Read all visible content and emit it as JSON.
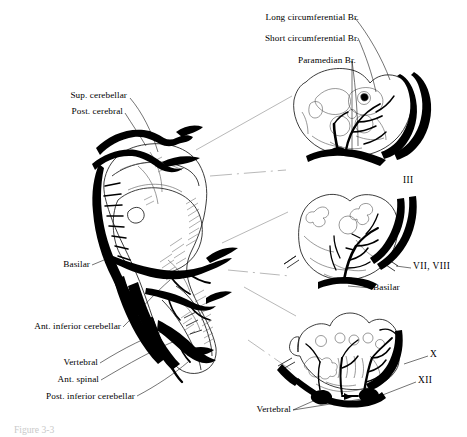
{
  "figure": {
    "title_caption": "Figure 3-3",
    "caption_visible": true
  },
  "labels": {
    "long_circumferential": "Long circumferential Br.",
    "short_circumferential": "Short circumferential Br.",
    "paramedian": "Paramedian Br.",
    "sup_cerebellar": "Sup. cerebellar",
    "post_cerebral": "Post. cerebral",
    "basilar_main": "Basilar",
    "ant_inferior_cerebellar": "Ant. inferior cerebellar",
    "vertebral_left": "Vertebral",
    "ant_spinal": "Ant. spinal",
    "post_inferior_cerebellar": "Post. inferior cerebellar",
    "basilar_section": "Basilar",
    "vertebral_bottom": "Vertebral"
  },
  "cranial_nerves": {
    "midbrain": "III",
    "pons": "VII, VIII",
    "medulla_vagus": "X",
    "medulla_hypoglossal": "XII"
  },
  "sections": [
    {
      "name": "midbrain-section",
      "nerve_label": "III",
      "branch_labels": [
        "Long circumferential Br.",
        "Short circumferential Br.",
        "Paramedian Br."
      ]
    },
    {
      "name": "pons-section",
      "nerve_label": "VII, VIII",
      "artery_labels": [
        "Basilar"
      ]
    },
    {
      "name": "medulla-section",
      "nerve_labels": [
        "X",
        "XII"
      ],
      "artery_labels": [
        "Vertebral"
      ]
    }
  ],
  "colors": {
    "ink": "#000000",
    "outline": "#1a1a1a",
    "hatch": "#4a4a4a",
    "leader": "#000000",
    "projection": "#7d7d7d",
    "background": "#ffffff",
    "caption": "#c9c9c9"
  }
}
